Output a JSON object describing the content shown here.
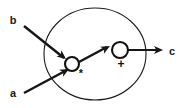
{
  "diagram": {
    "type": "dataflow-graph",
    "title": "",
    "background_color": "#ffffff",
    "stroke_color": "#161616",
    "boundary": {
      "shape": "ellipse",
      "label": "",
      "cx": 95,
      "cy": 54,
      "rx": 51,
      "ry": 46,
      "stroke_color": "#1a1a1a"
    },
    "inputs": [
      {
        "id": "input-b",
        "label": "b",
        "label_x": 13,
        "label_y": 24,
        "line_x1": 24,
        "line_y1": 26,
        "line_x2": 64,
        "line_y2": 58,
        "arrow_x": 66,
        "arrow_y": 59,
        "arrow_angle": 38,
        "target": "node-multiply"
      },
      {
        "id": "input-a",
        "label": "a",
        "label_x": 13,
        "label_y": 97,
        "line_x1": 24,
        "line_y1": 93,
        "line_x2": 67,
        "line_y2": 70,
        "arrow_x": 69,
        "arrow_y": 69,
        "arrow_angle": -29,
        "target": "node-multiply"
      }
    ],
    "nodes": [
      {
        "id": "node-multiply",
        "symbol": "*",
        "operation": "multiply",
        "cx": 72,
        "cy": 64,
        "r": 7,
        "symbol_x": 81,
        "symbol_y": 77
      },
      {
        "id": "node-add",
        "symbol": "+",
        "operation": "add",
        "cx": 120,
        "cy": 50,
        "r": 8,
        "symbol_x": 121,
        "symbol_y": 68
      }
    ],
    "edges": [
      {
        "id": "edge-multiply-to-add",
        "from": "node-multiply",
        "to": "node-add",
        "line_x1": 79,
        "line_y1": 62,
        "line_x2": 107,
        "line_y2": 47,
        "arrow_x": 110,
        "arrow_y": 46,
        "arrow_angle": -28
      }
    ],
    "outputs": [
      {
        "id": "output-c",
        "label": "c",
        "label_x": 172,
        "label_y": 55,
        "from": "node-add",
        "line_x1": 128,
        "line_y1": 50,
        "line_x2": 158,
        "line_y2": 50,
        "arrow_x": 163,
        "arrow_y": 50,
        "arrow_angle": 0
      }
    ]
  }
}
